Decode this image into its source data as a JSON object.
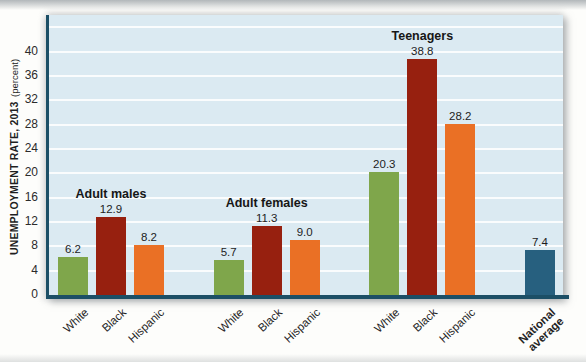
{
  "figure": {
    "y_axis": {
      "title_main": "UNEMPLOYMENT RATE, 2013",
      "title_unit": "(percent)"
    }
  },
  "chart_data": {
    "type": "bar",
    "title": "",
    "xlabel": "",
    "ylabel": "UNEMPLOYMENT RATE, 2013 (percent)",
    "ylabel_main": "UNEMPLOYMENT RATE, 2013",
    "ylabel_unit": "(percent)",
    "ylim": [
      0,
      46
    ],
    "yticks": [
      0,
      4,
      8,
      12,
      16,
      20,
      24,
      28,
      32,
      36,
      40
    ],
    "grid": "horizontal white lines every 4 units up to 44",
    "gridline_values": [
      4,
      8,
      12,
      16,
      20,
      24,
      28,
      32,
      36,
      40,
      44
    ],
    "legend": null,
    "groups": [
      {
        "title": "Adult males",
        "bars": [
          {
            "category": "White",
            "value": 6.2
          },
          {
            "category": "Black",
            "value": 12.9
          },
          {
            "category": "Hispanic",
            "value": 8.2
          }
        ]
      },
      {
        "title": "Adult females",
        "bars": [
          {
            "category": "White",
            "value": 5.7
          },
          {
            "category": "Black",
            "value": 11.3
          },
          {
            "category": "Hispanic",
            "value": 9.0
          }
        ]
      },
      {
        "title": "Teenagers",
        "bars": [
          {
            "category": "White",
            "value": 20.3
          },
          {
            "category": "Black",
            "value": 38.8
          },
          {
            "category": "Hispanic",
            "value": 28.2
          }
        ]
      },
      {
        "title": "",
        "bars": [
          {
            "category": "National average",
            "category_display": "National\naverage",
            "value": 7.4,
            "bold_category": true,
            "color_key": "national"
          }
        ]
      }
    ],
    "colors": {
      "White": "#7fa64b",
      "Black": "#97200f",
      "Hispanic": "#ea7025",
      "national": "#27607f",
      "axis": "#1c4f66",
      "plot_bg": "#dbeaf2",
      "grid": "#ffffff"
    }
  }
}
